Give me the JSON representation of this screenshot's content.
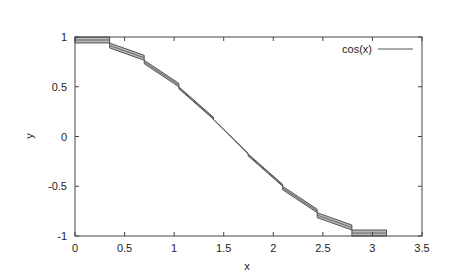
{
  "chart_data": {
    "type": "line",
    "title": "",
    "xlabel": "x",
    "ylabel": "y",
    "xlim": [
      0,
      3.5
    ],
    "ylim": [
      -1,
      1
    ],
    "xticks": [
      0,
      0.5,
      1,
      1.5,
      2,
      2.5,
      3,
      3.5
    ],
    "xtick_labels": [
      "0",
      "0.5",
      "1",
      "1.5",
      "2",
      "2.5",
      "3",
      "3.5"
    ],
    "yticks": [
      -1,
      -0.5,
      0,
      0.5,
      1
    ],
    "ytick_labels": [
      "-1",
      "-0.5",
      "0",
      "0.5",
      "1"
    ],
    "grid": false,
    "legend_position": "top-right",
    "series": [
      {
        "name": "cos(x)",
        "style": "piecewise linear segments with shaded error bands",
        "segments": [
          {
            "x0": 0.0,
            "x1": 0.349,
            "y0": 1.0,
            "y1": 0.94,
            "band": 0.06
          },
          {
            "x0": 0.349,
            "x1": 0.698,
            "y0": 0.94,
            "y1": 0.766,
            "band": 0.05
          },
          {
            "x0": 0.698,
            "x1": 1.047,
            "y0": 0.766,
            "y1": 0.5,
            "band": 0.035
          },
          {
            "x0": 1.047,
            "x1": 1.396,
            "y0": 0.5,
            "y1": 0.174,
            "band": 0.02
          },
          {
            "x0": 1.396,
            "x1": 1.745,
            "y0": 0.174,
            "y1": -0.174,
            "band": 0.004
          },
          {
            "x0": 1.745,
            "x1": 2.094,
            "y0": -0.174,
            "y1": -0.5,
            "band": 0.02
          },
          {
            "x0": 2.094,
            "x1": 2.443,
            "y0": -0.5,
            "y1": -0.766,
            "band": 0.035
          },
          {
            "x0": 2.443,
            "x1": 2.793,
            "y0": -0.766,
            "y1": -0.94,
            "band": 0.05
          },
          {
            "x0": 2.793,
            "x1": 3.142,
            "y0": -0.94,
            "y1": -1.0,
            "band": 0.06
          }
        ]
      }
    ]
  },
  "legend": {
    "label": "cos(x)"
  },
  "colors": {
    "axis": "#444444",
    "band_fill": "#b8b8b8",
    "band_stroke": "#333333",
    "line": "#555555"
  }
}
